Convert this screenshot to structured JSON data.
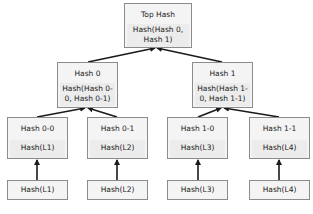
{
  "diagram": {
    "type": "merkle-tree",
    "root": {
      "title": "Top Hash",
      "content": "Hash(Hash 0, Hash 1)"
    },
    "level1": [
      {
        "title": "Hash 0",
        "content": "Hash(Hash 0-0, Hash 0-1)"
      },
      {
        "title": "Hash 1",
        "content": "Hash(Hash 1-0, Hash 1-1)"
      }
    ],
    "level2": [
      {
        "title": "Hash 0-0",
        "content": "Hash(L1)"
      },
      {
        "title": "Hash 0-1",
        "content": "Hash(L2)"
      },
      {
        "title": "Hash 1-0",
        "content": "Hash(L3)"
      },
      {
        "title": "Hash 1-1",
        "content": "Hash(L4)"
      }
    ],
    "leaves": [
      {
        "content": "Hash(L1)"
      },
      {
        "content": "Hash(L2)"
      },
      {
        "content": "Hash(L3)"
      },
      {
        "content": "Hash(L4)"
      }
    ],
    "edges": [
      {
        "from": "Hash 0",
        "to": "Top Hash"
      },
      {
        "from": "Hash 1",
        "to": "Top Hash"
      },
      {
        "from": "Hash 0-0",
        "to": "Hash 0"
      },
      {
        "from": "Hash 0-1",
        "to": "Hash 0"
      },
      {
        "from": "Hash 1-0",
        "to": "Hash 1"
      },
      {
        "from": "Hash 1-1",
        "to": "Hash 1"
      },
      {
        "from": "leaf Hash(L1)",
        "to": "Hash 0-0"
      },
      {
        "from": "leaf Hash(L2)",
        "to": "Hash 0-1"
      },
      {
        "from": "leaf Hash(L3)",
        "to": "Hash 1-0"
      },
      {
        "from": "leaf Hash(L4)",
        "to": "Hash 1-1"
      }
    ],
    "colors": {
      "box_fill": "#f4f4f4",
      "box_border": "#8c8c8c",
      "arrow": "#1a1a1a"
    }
  }
}
